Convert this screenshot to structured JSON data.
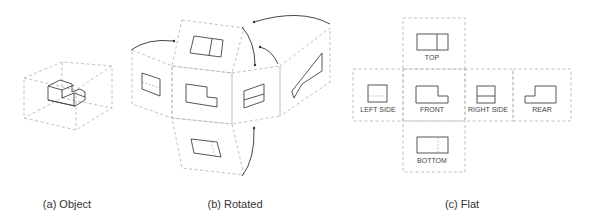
{
  "captions": {
    "object": "(a) Object",
    "rotated": "(b) Rotated",
    "flat": "(c) Flat"
  },
  "flat_labels": {
    "top": "TOP",
    "left_side": "LEFT SIDE",
    "front": "FRONT",
    "right_side": "RIGHT SIDE",
    "rear": "REAR",
    "bottom": "BOTTOM"
  },
  "colors": {
    "dashed_box": "#b9b9b9",
    "outline": "#444444",
    "background": "#ffffff"
  }
}
